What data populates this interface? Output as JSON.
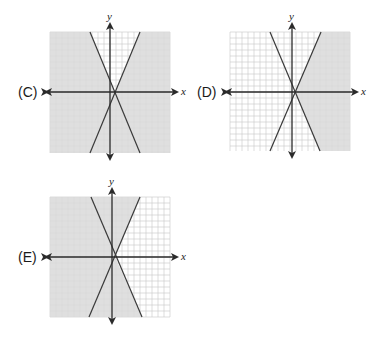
{
  "graphs": [
    {
      "id": "C",
      "label": "(C)",
      "x_axis_label": "x",
      "y_axis_label": "y",
      "shading": "all except upper wedge between lines",
      "box": {
        "left": 50,
        "top": 32,
        "right": 170,
        "bottom": 153
      },
      "origin": {
        "x": 110,
        "y": 92
      },
      "intersection": {
        "x": 115,
        "y": 93
      },
      "lines": [
        {
          "name": "negative-slope",
          "top_x": 90,
          "bottom_x": 140
        },
        {
          "name": "positive-slope",
          "top_x": 140,
          "bottom_x": 90
        }
      ]
    },
    {
      "id": "D",
      "label": "(D)",
      "x_axis_label": "x",
      "y_axis_label": "y",
      "shading": "right of both lines",
      "box": {
        "left": 230,
        "top": 32,
        "right": 350,
        "bottom": 151
      },
      "origin": {
        "x": 292,
        "y": 92
      },
      "intersection": {
        "x": 295,
        "y": 92
      },
      "lines": [
        {
          "name": "negative-slope",
          "top_x": 270,
          "bottom_x": 320
        },
        {
          "name": "positive-slope",
          "top_x": 321,
          "bottom_x": 270
        }
      ]
    },
    {
      "id": "E",
      "label": "(E)",
      "x_axis_label": "x",
      "y_axis_label": "y",
      "shading": "left of both lines",
      "box": {
        "left": 50,
        "top": 197,
        "right": 170,
        "bottom": 317
      },
      "origin": {
        "x": 112,
        "y": 257
      },
      "intersection": {
        "x": 115,
        "y": 257
      },
      "lines": [
        {
          "name": "negative-slope",
          "top_x": 91,
          "bottom_x": 142
        },
        {
          "name": "positive-slope",
          "top_x": 140,
          "bottom_x": 89
        }
      ]
    }
  ],
  "colors": {
    "shade": "#d9d9d9",
    "grid": "#c8c8c8",
    "grid_on_shade": "#c4c4c4",
    "axis": "#2a2a2a",
    "line": "#3a3a3a"
  }
}
